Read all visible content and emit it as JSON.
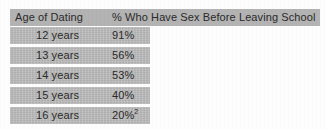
{
  "table": {
    "columns": [
      {
        "key": "age",
        "label": "Age of Dating"
      },
      {
        "key": "pct",
        "label": "% Who Have Sex Before Leaving School"
      }
    ],
    "rows": [
      {
        "age": "12 years",
        "pct": "91%",
        "footnote": ""
      },
      {
        "age": "13 years",
        "pct": "56%",
        "footnote": ""
      },
      {
        "age": "14 years",
        "pct": "53%",
        "footnote": ""
      },
      {
        "age": "15 years",
        "pct": "40%",
        "footnote": ""
      },
      {
        "age": "16 years",
        "pct": "20%",
        "footnote": "2"
      }
    ]
  },
  "chart_data": {
    "type": "table",
    "title": "",
    "xlabel": "Age of Dating",
    "ylabel": "% Who Have Sex Before Leaving School",
    "categories": [
      "12 years",
      "13 years",
      "14 years",
      "15 years",
      "16 years"
    ],
    "values": [
      91,
      56,
      53,
      40,
      20
    ],
    "annotations": [
      "Footnote marker 2 attached to the 16 years / 20% value"
    ]
  },
  "style": {
    "band_color": "#b8b8b8",
    "header_band_color": "#b3b3b3",
    "text_color": "#2a2a2a",
    "page_color": "#fdfdfd"
  }
}
